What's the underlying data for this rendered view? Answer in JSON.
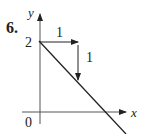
{
  "problem_number": "6.",
  "axes": {
    "x_label": "x",
    "y_label": "y",
    "origin_label": "0"
  },
  "y_intercept_label": "2",
  "slope_triangle": {
    "run_label": "1",
    "rise_label": "1"
  },
  "colors": {
    "ink": "#222222",
    "background": "#ffffff"
  }
}
